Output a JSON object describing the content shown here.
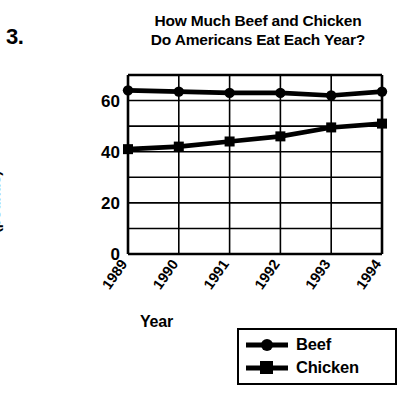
{
  "worksheet": {
    "problem_number": "3."
  },
  "chart_data": {
    "type": "line",
    "title": "How Much Beef and Chicken Do Americans Eat Each Year?",
    "title_lines": [
      "How Much Beef and Chicken",
      "Do Americans Eat Each Year?"
    ],
    "xlabel": "Year",
    "ylabel": "Consumption per Person (pounds)",
    "ylabel_lines": [
      "Consumption per Person",
      "(pounds)"
    ],
    "categories": [
      "1989",
      "1990",
      "1991",
      "1992",
      "1993",
      "1994"
    ],
    "series": [
      {
        "name": "Beef",
        "marker": "circle",
        "values": [
          64,
          63.5,
          63,
          63,
          62,
          63.5
        ]
      },
      {
        "name": "Chicken",
        "marker": "square",
        "values": [
          41,
          42,
          44,
          46,
          49.5,
          51
        ]
      }
    ],
    "ylim": [
      0,
      70
    ],
    "ytick_labels": [
      "0",
      "20",
      "40",
      "60"
    ],
    "ytick_values": [
      0,
      20,
      40,
      60
    ],
    "y_gridline_values": [
      0,
      10,
      20,
      30,
      40,
      50,
      60,
      70
    ],
    "grid": true,
    "legend_position": "bottom-right",
    "line_color": "#000000",
    "grid_color": "#000000",
    "background_color": "#ffffff"
  },
  "legend": {
    "items": [
      {
        "label": "Beef",
        "marker": "circle"
      },
      {
        "label": "Chicken",
        "marker": "square"
      }
    ]
  }
}
